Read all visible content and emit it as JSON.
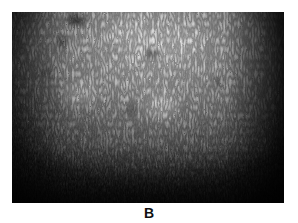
{
  "figure": {
    "panel_label": "B",
    "image": {
      "description": "grayscale close-up photograph of a speckled, fibrous surface texture with bright top-center region and dark vignetted edges",
      "tone": "monochrome",
      "colors": {
        "highlight": "#e8e8e8",
        "midtone": "#8a8a8a",
        "shadow": "#0a0a0a",
        "background": "#ffffff"
      }
    }
  }
}
